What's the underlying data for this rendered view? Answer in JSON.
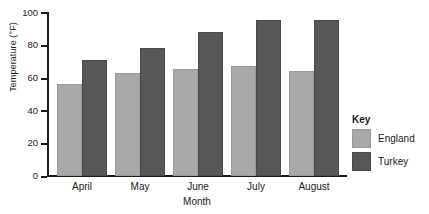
{
  "chart_data": {
    "type": "bar",
    "title": "",
    "xlabel": "Month",
    "ylabel": "Temperature (°F)",
    "categories": [
      "April",
      "May",
      "June",
      "July",
      "August"
    ],
    "series": [
      {
        "name": "England",
        "color": "#a9a9a9",
        "values": [
          56,
          63,
          65,
          67,
          64
        ]
      },
      {
        "name": "Turkey",
        "color": "#575757",
        "values": [
          71,
          78,
          88,
          95,
          95
        ]
      }
    ],
    "ylim": [
      0,
      100
    ],
    "yticks": [
      "0",
      "20",
      "40",
      "60",
      "80",
      "100"
    ],
    "grid": false,
    "legend_position": "right",
    "legend_title": "Key"
  }
}
